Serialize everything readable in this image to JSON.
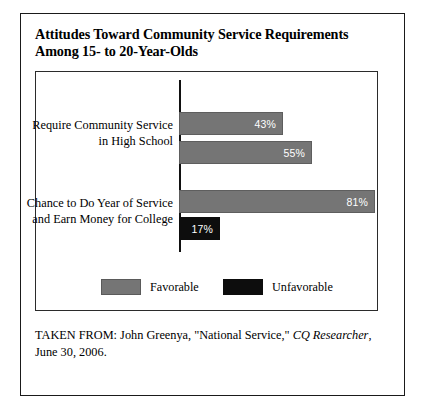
{
  "figure": {
    "title_lines": [
      "Attitudes Toward Community Service Requirements",
      "Among 15- to 20-Year-Olds"
    ],
    "source_note": {
      "prefix": "TAKEN FROM: John Greenya, \"National Service,\" ",
      "publication": "CQ Researcher",
      "suffix": ",",
      "second_line": "June 30, 2006."
    }
  },
  "chart_data": {
    "type": "bar",
    "orientation": "horizontal",
    "title": "Attitudes Toward Community Service Requirements Among 15- to 20-Year-Olds",
    "xlabel": "",
    "ylabel": "",
    "xlim": [
      0,
      100
    ],
    "grid": false,
    "value_suffix": "%",
    "legend_position": "bottom-inside",
    "categories": [
      "Require Community Service in High School",
      "Chance to Do Year of Service and Earn Money for College"
    ],
    "category_label_lines": [
      [
        "Require Community Service",
        "in High School"
      ],
      [
        "Chance to Do Year of Service",
        "and Earn Money for College"
      ]
    ],
    "series": [
      {
        "name": "Favorable",
        "color": "#757575",
        "values": [
          43,
          81
        ]
      },
      {
        "name": "Unfavorable",
        "color": "#0d0d0d",
        "values": [
          55,
          17
        ]
      }
    ],
    "bars": [
      {
        "category_index": 0,
        "series": "Favorable",
        "value": 43,
        "label": "43%",
        "color": "#757575"
      },
      {
        "category_index": 0,
        "series": "Unfavorable",
        "value": 55,
        "label": "55%",
        "color": "#0d0d0d"
      },
      {
        "category_index": 1,
        "series": "Favorable",
        "value": 81,
        "label": "81%",
        "color": "#757575"
      },
      {
        "category_index": 1,
        "series": "Unfavorable",
        "value": 17,
        "label": "17%",
        "color": "#0d0d0d"
      }
    ],
    "legend": [
      {
        "label": "Favorable",
        "color": "#757575"
      },
      {
        "label": "Unfavorable",
        "color": "#0d0d0d"
      }
    ]
  }
}
